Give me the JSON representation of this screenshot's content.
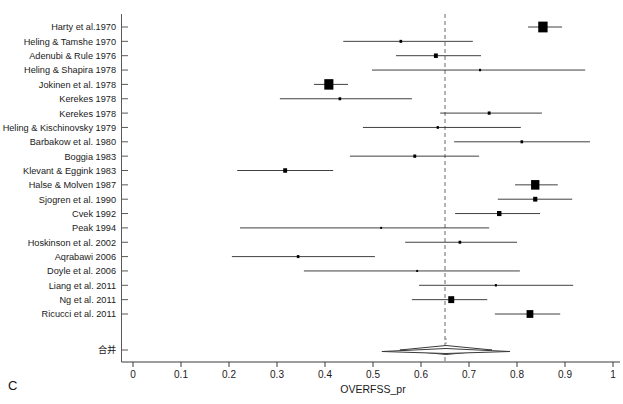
{
  "figure": {
    "panel_letter": "C",
    "axis_title": "OVERFSS_pr",
    "summary_label": "合并"
  },
  "chart_data": {
    "type": "forest",
    "title": "",
    "xlabel": "OVERFSS_pr",
    "ylabel": "",
    "xlim": [
      0,
      1
    ],
    "xticks": [
      0,
      0.1,
      0.2,
      0.3,
      0.4,
      0.5,
      0.6,
      0.7,
      0.8,
      0.9,
      1
    ],
    "xtick_labels": [
      "0",
      "0.1",
      "0.2",
      "0.3",
      "0.4",
      "0.5",
      "0.6",
      "0.7",
      "0.8",
      "0.9",
      "1"
    ],
    "grid": false,
    "legend": "none",
    "reference_line": 0.65,
    "studies": [
      {
        "label": "Harty et al.1970",
        "estimate": 0.854,
        "ci_low": 0.823,
        "ci_high": 0.894,
        "weight_size": 3.6
      },
      {
        "label": "Heling & Tamshe 1970",
        "estimate": 0.558,
        "ci_low": 0.438,
        "ci_high": 0.708,
        "weight_size": 1.0
      },
      {
        "label": "Adenubi & Rule 1976",
        "estimate": 0.631,
        "ci_low": 0.548,
        "ci_high": 0.725,
        "weight_size": 1.5
      },
      {
        "label": "Heling & Shapira 1978",
        "estimate": 0.723,
        "ci_low": 0.498,
        "ci_high": 0.942,
        "weight_size": 0.8
      },
      {
        "label": "Jokinen et al. 1978",
        "estimate": 0.408,
        "ci_low": 0.377,
        "ci_high": 0.448,
        "weight_size": 3.5
      },
      {
        "label": "Kerekes 1978",
        "estimate": 0.431,
        "ci_low": 0.306,
        "ci_high": 0.581,
        "weight_size": 1.0
      },
      {
        "label": "Kerekes 1978",
        "estimate": 0.742,
        "ci_low": 0.64,
        "ci_high": 0.852,
        "weight_size": 1.1
      },
      {
        "label": "Heling & Kischinovsky 1979",
        "estimate": 0.635,
        "ci_low": 0.479,
        "ci_high": 0.808,
        "weight_size": 0.9
      },
      {
        "label": "Barbakow et al. 1980",
        "estimate": 0.81,
        "ci_low": 0.669,
        "ci_high": 0.952,
        "weight_size": 1.0
      },
      {
        "label": "Boggia 1983",
        "estimate": 0.587,
        "ci_low": 0.452,
        "ci_high": 0.721,
        "weight_size": 1.1
      },
      {
        "label": "Klevant & Eggink 1983",
        "estimate": 0.317,
        "ci_low": 0.217,
        "ci_high": 0.417,
        "weight_size": 1.5
      },
      {
        "label": "Halse & Molven 1987",
        "estimate": 0.838,
        "ci_low": 0.796,
        "ci_high": 0.885,
        "weight_size": 3.2
      },
      {
        "label": "Sjogren et al. 1990",
        "estimate": 0.838,
        "ci_low": 0.76,
        "ci_high": 0.915,
        "weight_size": 1.6
      },
      {
        "label": "Cvek 1992",
        "estimate": 0.763,
        "ci_low": 0.671,
        "ci_high": 0.848,
        "weight_size": 1.7
      },
      {
        "label": "Peak 1994",
        "estimate": 0.517,
        "ci_low": 0.223,
        "ci_high": 0.742,
        "weight_size": 0.7
      },
      {
        "label": "Hoskinson et al. 2002",
        "estimate": 0.681,
        "ci_low": 0.567,
        "ci_high": 0.8,
        "weight_size": 1.0
      },
      {
        "label": "Aqrabawi 2006",
        "estimate": 0.344,
        "ci_low": 0.206,
        "ci_high": 0.504,
        "weight_size": 1.0
      },
      {
        "label": "Doyle et al. 2006",
        "estimate": 0.592,
        "ci_low": 0.356,
        "ci_high": 0.806,
        "weight_size": 0.7
      },
      {
        "label": "Liang et al. 2011",
        "estimate": 0.756,
        "ci_low": 0.596,
        "ci_high": 0.917,
        "weight_size": 0.8
      },
      {
        "label": "Ng et al. 2011",
        "estimate": 0.663,
        "ci_low": 0.581,
        "ci_high": 0.738,
        "weight_size": 2.3
      },
      {
        "label": "Ricucci et al. 2011",
        "estimate": 0.827,
        "ci_low": 0.754,
        "ci_high": 0.89,
        "weight_size": 2.6
      }
    ],
    "summary": {
      "label": "合并",
      "estimate": 0.652,
      "ci_low": 0.556,
      "ci_high": 0.748
    }
  }
}
